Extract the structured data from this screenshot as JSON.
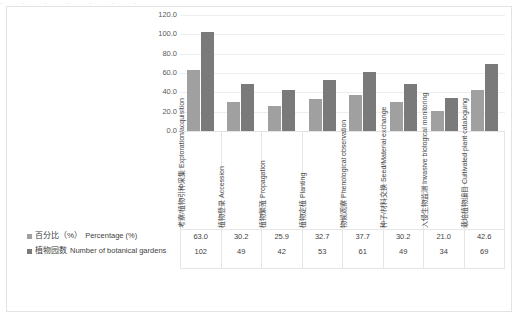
{
  "top_clip_text": "· · · · · · ·",
  "chart_data": {
    "type": "bar",
    "title": "",
    "subtitle": "",
    "xlabel": "",
    "ylabel": "",
    "ylim": [
      0,
      120
    ],
    "ytick_labels": [
      "120.0",
      "100.0",
      "80.0",
      "60.0",
      "40.0",
      "20.0",
      "0.0"
    ],
    "yticks": [
      120,
      100,
      80,
      60,
      40,
      20,
      0
    ],
    "grid": true,
    "legend_position": "data-table-left",
    "data_table": true,
    "categories": [
      "考察/植物引种采集 Exploration/acquisition",
      "植物登录 Accession",
      "植物繁殖 Propagation",
      "植物定植 Planting",
      "物候观察 Phenological observation",
      "种子/材料交换 Seed/Material exchange",
      "入侵生物监测 Invasive biological monitoring",
      "栽培植物编目 Cultivated plant cataloguing"
    ],
    "categories_cn": [
      "考察/植物引种采集",
      "植物登录",
      "植物繁殖",
      "植物定植",
      "物候观察",
      "种子/材料交换",
      "入侵生物监测",
      "栽培植物编目"
    ],
    "categories_en": [
      "Exploration/acquisition",
      "Accession",
      "Propagation",
      "Planting",
      "Phenological observation",
      "Seed/Material exchange",
      "Invasive biological monitoring",
      "Cultivated plant cataloguing"
    ],
    "series": [
      {
        "name": "百分比（%）Percentage (%)",
        "name_cn": "百分比（%）",
        "name_en": "Percentage (%)",
        "color": "#a0a0a0",
        "values": [
          63.0,
          30.2,
          25.9,
          32.7,
          37.7,
          30.2,
          21.0,
          42.6
        ],
        "display": [
          "63.0",
          "30.2",
          "25.9",
          "32.7",
          "37.7",
          "30.2",
          "21.0",
          "42.6"
        ]
      },
      {
        "name": "植物园数 Number of botanical gardens",
        "name_cn": "植物园数",
        "name_en": "Number of botanical gardens",
        "color": "#7a7a7a",
        "values": [
          102,
          49,
          42,
          53,
          61,
          49,
          34,
          69
        ],
        "display": [
          "102",
          "49",
          "42",
          "53",
          "61",
          "49",
          "34",
          "69"
        ]
      }
    ]
  }
}
